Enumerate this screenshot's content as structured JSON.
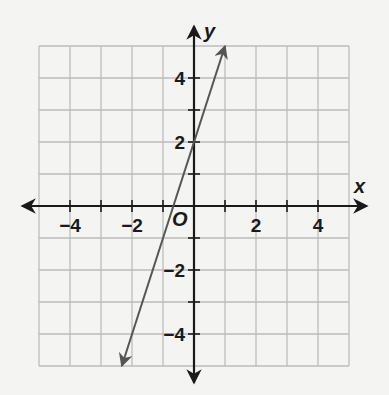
{
  "chart_data": {
    "type": "line",
    "title": "",
    "xlabel": "x",
    "ylabel": "y",
    "origin_label": "O",
    "xlim": [
      -5,
      5
    ],
    "ylim": [
      -5,
      5
    ],
    "grid": true,
    "x_ticks": [
      -4,
      -2,
      2,
      4
    ],
    "y_ticks": [
      4,
      2,
      -2,
      -4
    ],
    "x_tick_labels": [
      "−4",
      "−2",
      "2",
      "4"
    ],
    "y_tick_labels": [
      "4",
      "2",
      "−2",
      "−4"
    ],
    "series": [
      {
        "name": "line",
        "equation": "y = 3x + 2",
        "slope": 3,
        "intercept": 2,
        "x": [
          -2.33,
          1
        ],
        "y": [
          -5,
          5
        ],
        "arrows": "both",
        "color": "#555555"
      }
    ]
  },
  "colors": {
    "axis": "#1a1a1a",
    "grid": "#bdbdbd",
    "line": "#555555",
    "background": "#f4f4f3"
  }
}
